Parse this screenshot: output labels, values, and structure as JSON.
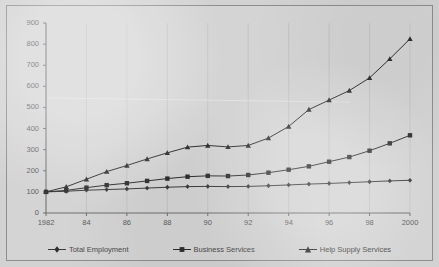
{
  "chart_data": {
    "type": "line",
    "title": "",
    "xlabel": "",
    "ylabel": "",
    "x": [
      1982,
      1983,
      1984,
      1985,
      1986,
      1987,
      1988,
      1989,
      1990,
      1991,
      1992,
      1993,
      1994,
      1995,
      1996,
      1997,
      1998,
      1999,
      2000
    ],
    "xtick_labels": [
      "1982",
      "84",
      "86",
      "88",
      "90",
      "92",
      "94",
      "96",
      "98",
      "2000"
    ],
    "xtick_values": [
      1982,
      1984,
      1986,
      1988,
      1990,
      1992,
      1994,
      1996,
      1998,
      2000
    ],
    "ytick_labels": [
      "0",
      "100",
      "200",
      "300",
      "400",
      "500",
      "600",
      "700",
      "800",
      "900"
    ],
    "ytick_values": [
      0,
      100,
      200,
      300,
      400,
      500,
      600,
      700,
      800,
      900
    ],
    "ylim": [
      0,
      900
    ],
    "xlim": [
      1982,
      2000
    ],
    "grid": false,
    "legend_position": "bottom",
    "series": [
      {
        "name": "Total Employment",
        "marker": "diamond",
        "color": "#3a3a3a",
        "values": [
          100,
          103,
          108,
          111,
          114,
          118,
          122,
          125,
          126,
          125,
          126,
          129,
          133,
          137,
          140,
          144,
          148,
          152,
          155
        ]
      },
      {
        "name": "Business Services",
        "marker": "square",
        "color": "#2e2e2e",
        "values": [
          100,
          107,
          120,
          132,
          141,
          152,
          163,
          172,
          176,
          175,
          180,
          191,
          205,
          221,
          243,
          265,
          295,
          330,
          368
        ]
      },
      {
        "name": "Help Supply Services",
        "marker": "triangle",
        "color": "#2e2e2e",
        "values": [
          100,
          124,
          160,
          196,
          225,
          256,
          285,
          312,
          320,
          313,
          320,
          355,
          410,
          490,
          535,
          580,
          640,
          730,
          825
        ]
      }
    ]
  },
  "legend": {
    "items": [
      {
        "label": "Total Employment"
      },
      {
        "label": "Business Services"
      },
      {
        "label": "Help Supply Services"
      }
    ]
  },
  "figure": {
    "background_color": "#d2d2d2",
    "plot_background_color": "#d4d4d4",
    "border_color": "#8e8e8e",
    "axis_color": "#6f6f6f",
    "text_color": "#5d5d5d"
  }
}
